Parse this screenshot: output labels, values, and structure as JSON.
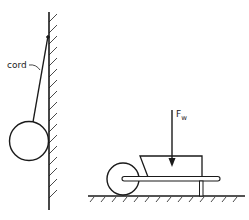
{
  "diagram": {
    "labels": {
      "cord": "cord",
      "force_main": "F",
      "force_sub": "w"
    },
    "colors": {
      "line": "#1a1a1a",
      "background": "#ffffff"
    }
  }
}
